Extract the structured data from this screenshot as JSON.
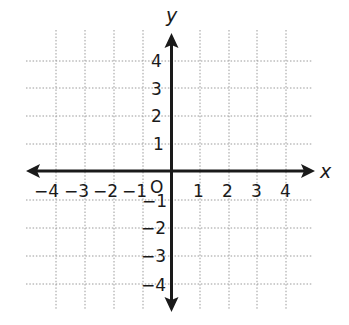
{
  "diagram": {
    "type": "coordinate-plane",
    "x_axis_label": "x",
    "y_axis_label": "y",
    "origin_label": "O",
    "x_range": [
      -4,
      4
    ],
    "y_range": [
      -4,
      4
    ],
    "grid": "dotted",
    "x_tick_labels": [
      "−4",
      "−3",
      "−2",
      "−1",
      "1",
      "2",
      "3",
      "4"
    ],
    "y_tick_labels": [
      "4",
      "3",
      "2",
      "1",
      "−1",
      "−2",
      "−3",
      "−4"
    ],
    "colors": {
      "axis": "#1a1a1a",
      "grid": "#9a9a9a",
      "background": "#ffffff"
    }
  },
  "labels": {
    "x": "x",
    "y": "y",
    "origin": "O",
    "xm4": "−4",
    "xm3": "−3",
    "xm2": "−2",
    "xm1": "−1",
    "x1": "1",
    "x2": "2",
    "x3": "3",
    "x4": "4",
    "y4": "4",
    "y3": "3",
    "y2": "2",
    "y1": "1",
    "ym1": "−1",
    "ym2": "−2",
    "ym3": "−3",
    "ym4": "−4"
  }
}
